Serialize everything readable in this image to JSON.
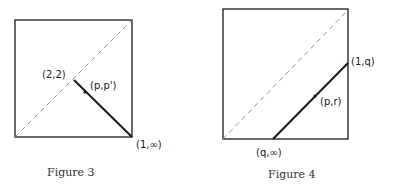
{
  "figures": [
    {
      "caption": "Figure 3",
      "labels": {
        "diag_point": "(2,2)",
        "moving_point": "(p,p')",
        "corner_point": "(1,∞)"
      }
    },
    {
      "caption": "Figure 4",
      "labels": {
        "right_point": "(1,q)",
        "moving_point": "(p,r)",
        "bottom_point": "(q,∞)"
      }
    }
  ],
  "colors": {
    "stroke": "#1a1a1a",
    "dashed": "#888888",
    "background": "#ffffff"
  }
}
